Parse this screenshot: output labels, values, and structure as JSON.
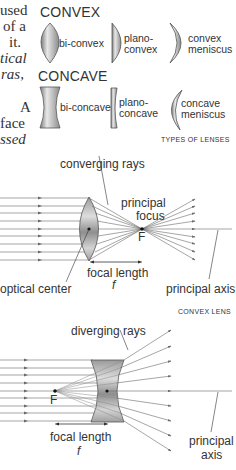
{
  "side_text": [
    {
      "text": "used",
      "italic": false
    },
    {
      "text": "of a",
      "italic": false
    },
    {
      "text": "it.",
      "italic": false
    },
    {
      "text": "tical",
      "italic": true
    },
    {
      "text": "ras,",
      "italic": true
    },
    {
      "text": "A",
      "italic": false
    },
    {
      "text": "face",
      "italic": false
    },
    {
      "text": "ssed",
      "italic": true
    }
  ],
  "lens_types": {
    "caption": "TYPES OF LENSES",
    "convex": {
      "heading": "CONVEX",
      "items": [
        {
          "label_line1": "bi-convex",
          "label_line2": ""
        },
        {
          "label_line1": "plano-",
          "label_line2": "convex"
        },
        {
          "label_line1": "convex",
          "label_line2": "meniscus"
        }
      ]
    },
    "concave": {
      "heading": "CONCAVE",
      "items": [
        {
          "label_line1": "bi-concave",
          "label_line2": ""
        },
        {
          "label_line1": "plano-",
          "label_line2": "concave"
        },
        {
          "label_line1": "concave",
          "label_line2": "meniscus"
        }
      ]
    }
  },
  "convex_diagram": {
    "caption": "CONVEX LENS",
    "rays_label": "converging rays",
    "focus_label_line1": "principal",
    "focus_label_line2": "focus",
    "focus_letter": "F",
    "center_label": "optical center",
    "focal_length_label": "focal length",
    "focal_symbol": "f",
    "axis_label": "principal axis"
  },
  "concave_diagram": {
    "rays_label": "diverging rays",
    "focus_letter": "F",
    "focal_length_label": "focal length",
    "focal_symbol": "f",
    "axis_label_line1": "principal",
    "axis_label_line2": "axis"
  },
  "colors": {
    "ray": "#6a6a6a",
    "lens_light": "#e6e6e6",
    "lens_dark": "#8c8c8c",
    "text": "#333333"
  }
}
